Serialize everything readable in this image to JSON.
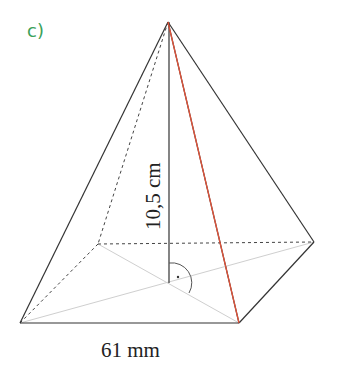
{
  "task_label": "c)",
  "figure": {
    "type": "square pyramid",
    "height_label": "10,5 cm",
    "base_edge_label": "61 mm",
    "colors": {
      "edges": "#333333",
      "hidden": "#444444",
      "diagonals": "#c8c8c8",
      "slant_height": "#e0533a",
      "label": "#3aa15a"
    }
  }
}
